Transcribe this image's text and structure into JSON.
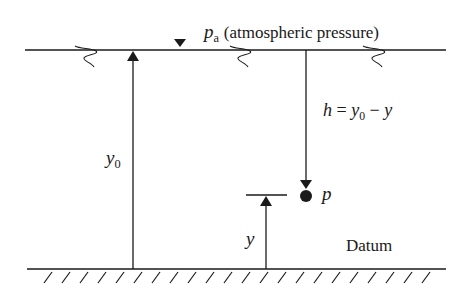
{
  "diagram": {
    "type": "hydrostatic-pressure-diagram",
    "colors": {
      "line": "#1a1a1a",
      "background": "#ffffff"
    },
    "free_surface": {
      "label_symbol": "p",
      "label_subscript": "a",
      "label_text": "(atmospheric pressure)",
      "marker": "inverted-triangle"
    },
    "depth_arrow": {
      "label_lhs": "h",
      "label_eq": "=",
      "label_y0": "y",
      "label_y0_sub": "0",
      "label_minus": "−",
      "label_y": "y"
    },
    "point": {
      "label": "p"
    },
    "height_y0": {
      "label": "y",
      "subscript": "0"
    },
    "height_y": {
      "label": "y"
    },
    "datum": {
      "label": "Datum"
    }
  }
}
